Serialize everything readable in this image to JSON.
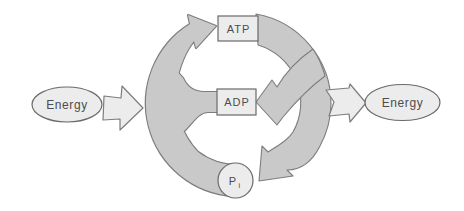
{
  "diagram": {
    "nodes": {
      "energy_in": "Energy",
      "atp": "ATP",
      "adp": "ADP",
      "pi_main": "P",
      "pi_sub": "i",
      "energy_out": "Energy"
    },
    "edges": [
      "Energy (left) feeds into cycle",
      "ADP + Pi recharge arrow curves up to ATP",
      "ATP breakdown arrow curves down and points to ADP",
      "ATP breakdown arrow branch points to Pi",
      "Cycle releases Energy (right)"
    ],
    "colors": {
      "background": "#ffffff",
      "band_fill": "#c9c9c9",
      "light_fill": "#ececec",
      "band_outline": "#7d7d7d",
      "node_outline": "#6a6a6a",
      "text": "#4d4d4d"
    }
  }
}
